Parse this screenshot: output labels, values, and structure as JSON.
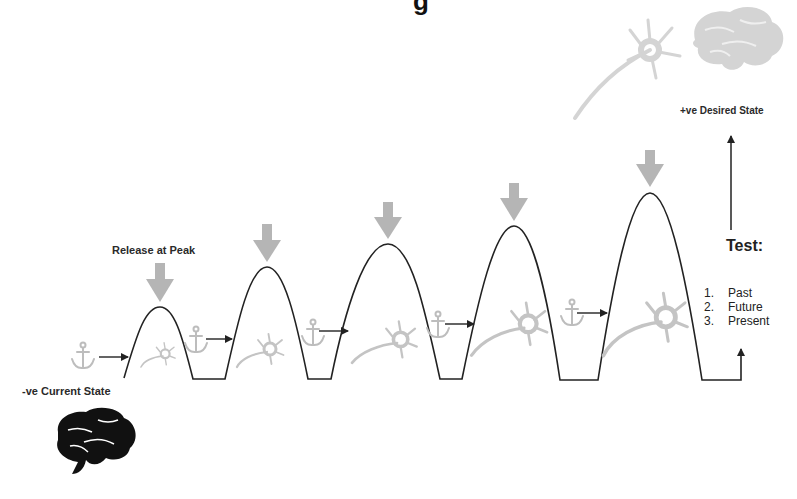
{
  "diagram": {
    "title_fragment": "g",
    "labels": {
      "release": "Release at Peak",
      "current_state": "-ve Current State",
      "desired_state": "+ve Desired State",
      "test_heading": "Test:"
    },
    "test_steps": [
      {
        "num": "1.",
        "text": "Past"
      },
      {
        "num": "2.",
        "text": "Future"
      },
      {
        "num": "3.",
        "text": "Present"
      }
    ],
    "peaks": [
      {
        "x": 160,
        "y": 307
      },
      {
        "x": 267,
        "y": 267
      },
      {
        "x": 388,
        "y": 244
      },
      {
        "x": 514,
        "y": 226
      },
      {
        "x": 650,
        "y": 193
      }
    ],
    "icons": {
      "release_arrow": "down-arrow-icon",
      "anchor": "anchor-icon",
      "neuron": "neuron-icon",
      "brain_current": "brain-icon",
      "brain_desired": "brain-icon"
    },
    "colors": {
      "line": "#222222",
      "release_arrow": "#b5b5b5",
      "anchor": "#bdbdbd",
      "neuron": "#c4c4c4",
      "brain_current": "#111111",
      "brain_desired": "#d4d4d4"
    }
  }
}
